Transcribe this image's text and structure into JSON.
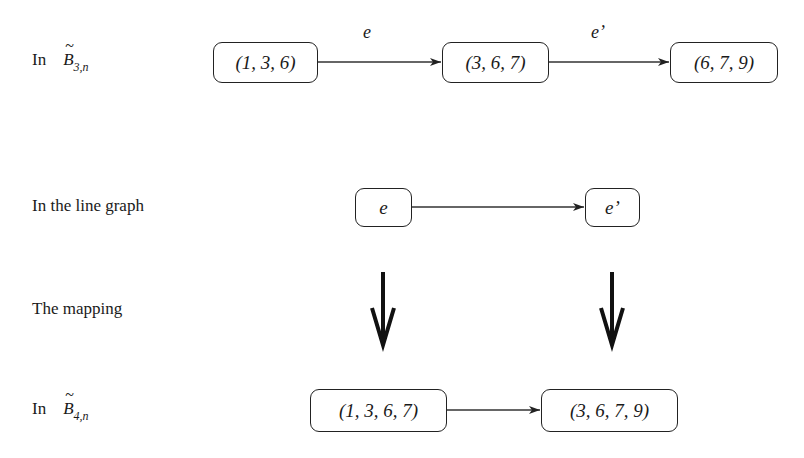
{
  "rows": {
    "top": {
      "label_prefix": "In",
      "label_symbol": "B",
      "label_tilde": "~",
      "label_subscript": "3,n",
      "nodes": [
        "(1, 3, 6)",
        "(3, 6, 7)",
        "(6, 7, 9)"
      ],
      "edges": [
        {
          "from": 0,
          "to": 1,
          "label": "e"
        },
        {
          "from": 1,
          "to": 2,
          "label": "e’"
        }
      ]
    },
    "line_graph": {
      "label": "In the line graph",
      "nodes": [
        "e",
        "e’"
      ],
      "edges": [
        {
          "from": 0,
          "to": 1
        }
      ]
    },
    "mapping": {
      "label": "The mapping",
      "arrows": [
        "down-arrow",
        "down-arrow"
      ]
    },
    "bottom": {
      "label_prefix": "In",
      "label_symbol": "B",
      "label_tilde": "~",
      "label_subscript": "4,n",
      "nodes": [
        "(1, 3, 6, 7)",
        "(3, 6, 7, 9)"
      ],
      "edges": [
        {
          "from": 0,
          "to": 1
        }
      ]
    }
  },
  "colors": {
    "stroke": "#222222",
    "background": "#ffffff"
  }
}
